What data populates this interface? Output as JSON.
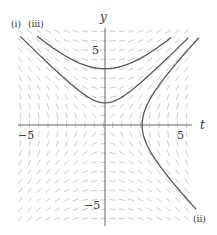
{
  "figure": {
    "axes": {
      "x_label": "t",
      "y_label": "y",
      "x_ticks": [
        "−5",
        "5"
      ],
      "y_ticks": [
        "5",
        "−5"
      ],
      "xlim": [
        -5.5,
        5.5
      ],
      "ylim": [
        -6,
        6.2
      ]
    },
    "curve_labels": {
      "i": "(i)",
      "ii": "(ii)",
      "iii": "(iii)"
    },
    "slope_field": {
      "description": "slope field dy/dt = t/y",
      "color": "#bdbdbd"
    },
    "curves": [
      {
        "id": "iii",
        "equation": "y^2 - t^2 = 13",
        "branch": "upper",
        "color": "#555555"
      },
      {
        "id": "i",
        "equation": "y^2 - t^2 = 2",
        "branch": "upper",
        "color": "#555555"
      },
      {
        "id": "ii",
        "equation": "t^2 - y^2 = 5.8",
        "branch": "right",
        "color": "#555555"
      }
    ]
  }
}
